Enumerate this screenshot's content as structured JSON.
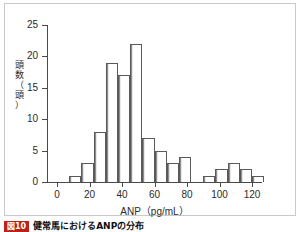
{
  "figure": {
    "caption_badge": "図10",
    "caption_text": "健常馬におけるANPの分布"
  },
  "chart_data": {
    "type": "bar",
    "title": "",
    "subtitle": "",
    "xlabel": "ANP（pg/mL）",
    "ylabel": "頭数（頭）",
    "ylabel_chars": [
      "頭",
      "数",
      "（",
      "頭",
      "）"
    ],
    "grid": false,
    "legend": null,
    "xlim": [
      0,
      130
    ],
    "ylim": [
      0,
      25
    ],
    "bin_width": 7.5,
    "x_ticks": [
      0,
      20,
      40,
      60,
      80,
      100,
      120
    ],
    "x_tick_labels": [
      "0",
      "20",
      "40",
      "60",
      "80",
      "100",
      "120"
    ],
    "y_ticks": [
      0,
      5,
      10,
      15,
      20,
      25
    ],
    "y_tick_labels": [
      "0",
      "5",
      "10",
      "15",
      "20",
      "25"
    ],
    "categories": [
      "0–7.5",
      "7.5–15",
      "15–22.5",
      "22.5–30",
      "30–37.5",
      "37.5–45",
      "45–52.5",
      "52.5–60",
      "60–67.5",
      "67.5–75",
      "75–82.5",
      "82.5–90",
      "90–97.5",
      "97.5–105",
      "105–112.5",
      "112.5–120",
      "120–127.5"
    ],
    "bin_starts": [
      0,
      7.5,
      15,
      22.5,
      30,
      37.5,
      45,
      52.5,
      60,
      67.5,
      75,
      82.5,
      90,
      97.5,
      105,
      112.5,
      120
    ],
    "values": [
      0,
      1,
      3,
      8,
      19,
      17,
      22,
      7,
      5,
      3,
      4,
      0,
      1,
      2,
      3,
      2,
      1
    ],
    "total_count": 98,
    "bar_fill": "#ffffff",
    "bar_stroke": "#5a5a5a",
    "axis_color": "#4a4a4a",
    "text_color": "#2b2b2b"
  }
}
